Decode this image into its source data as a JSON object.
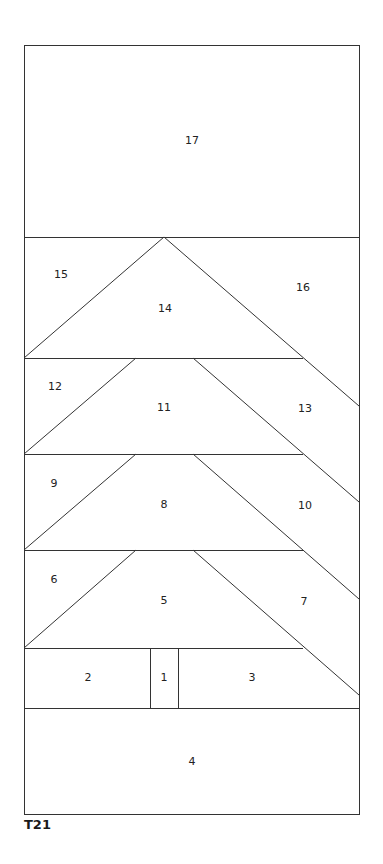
{
  "diagram": {
    "title": "T21",
    "type": "quilt-block-pattern",
    "line_color": "#333333",
    "background": "#ffffff",
    "frame": {
      "x1": 24,
      "y1": 45,
      "x2": 359,
      "y2": 814
    },
    "pieces": [
      {
        "id": "1",
        "label": "1",
        "x": 164,
        "y": 678,
        "description": "trunk"
      },
      {
        "id": "2",
        "label": "2",
        "x": 88,
        "y": 678
      },
      {
        "id": "3",
        "label": "3",
        "x": 252,
        "y": 678
      },
      {
        "id": "4",
        "label": "4",
        "x": 192,
        "y": 762
      },
      {
        "id": "5",
        "label": "5",
        "x": 164,
        "y": 601
      },
      {
        "id": "6",
        "label": "6",
        "x": 54,
        "y": 580
      },
      {
        "id": "7",
        "label": "7",
        "x": 304,
        "y": 602
      },
      {
        "id": "8",
        "label": "8",
        "x": 164,
        "y": 505
      },
      {
        "id": "9",
        "label": "9",
        "x": 54,
        "y": 484
      },
      {
        "id": "10",
        "label": "10",
        "x": 305,
        "y": 506
      },
      {
        "id": "11",
        "label": "11",
        "x": 164,
        "y": 408
      },
      {
        "id": "12",
        "label": "12",
        "x": 55,
        "y": 387
      },
      {
        "id": "13",
        "label": "13",
        "x": 305,
        "y": 409
      },
      {
        "id": "14",
        "label": "14",
        "x": 165,
        "y": 309
      },
      {
        "id": "15",
        "label": "15",
        "x": 61,
        "y": 275
      },
      {
        "id": "16",
        "label": "16",
        "x": 303,
        "y": 288
      },
      {
        "id": "17",
        "label": "17",
        "x": 192,
        "y": 141
      }
    ]
  }
}
